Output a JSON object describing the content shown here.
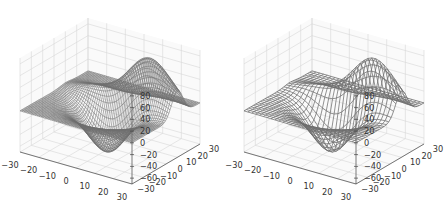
{
  "chart_data": [
    {
      "type": "wireframe3d",
      "title": "",
      "function": "matplotlib axes3d test data (sum of two Gaussians, scaled)",
      "x_range": [
        -30,
        30
      ],
      "y_range": [
        -30,
        30
      ],
      "z_range": [
        -70,
        90
      ],
      "x_ticks": [
        "−30",
        "−20",
        "−10",
        "0",
        "10",
        "20",
        "30"
      ],
      "y_ticks": [
        "−30",
        "−20",
        "−10",
        "0",
        "10",
        "20",
        "30"
      ],
      "z_ticks": [
        "−60",
        "−40",
        "−20",
        "0",
        "20",
        "40",
        "60",
        "80"
      ],
      "grid": true,
      "line_color": "#6e6e6e",
      "stride": 1,
      "grid_points": 60
    },
    {
      "type": "wireframe3d",
      "title": "",
      "function": "matplotlib axes3d test data (sum of two Gaussians, scaled)",
      "x_range": [
        -30,
        30
      ],
      "y_range": [
        -30,
        30
      ],
      "z_range": [
        -70,
        90
      ],
      "x_ticks": [
        "−30",
        "−20",
        "−10",
        "0",
        "10",
        "20",
        "30"
      ],
      "y_ticks": [
        "−30",
        "−20",
        "−10",
        "0",
        "10",
        "20",
        "30"
      ],
      "z_ticks": [
        "−60",
        "−40",
        "−20",
        "0",
        "20",
        "40",
        "60",
        "80"
      ],
      "grid": true,
      "line_color": "#6e6e6e",
      "stride": 2,
      "grid_points": 30
    }
  ],
  "panels": [
    {
      "offset_x": 0
    },
    {
      "offset_x": 224
    }
  ]
}
